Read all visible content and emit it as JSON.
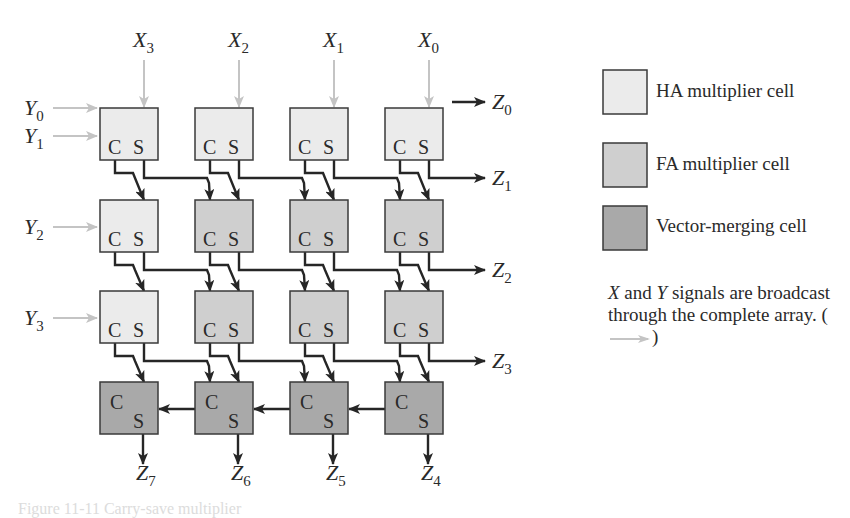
{
  "figure": {
    "colors": {
      "ha_fill": "#ebebeb",
      "fa_fill": "#cfcfcf",
      "vm_fill": "#a9a9a9",
      "border": "#3a3a3a",
      "wire": "#262626",
      "broadcast_arrow": "#c4c4c4",
      "text": "#2a2a2a"
    },
    "x_inputs": [
      "X3",
      "X2",
      "X1",
      "X0"
    ],
    "y_inputs": [
      {
        "name": "Y0",
        "row": 0,
        "offset": -12
      },
      {
        "name": "Y1",
        "row": 0,
        "offset": 16
      },
      {
        "name": "Y2",
        "row": 1,
        "offset": 0
      },
      {
        "name": "Y3",
        "row": 2,
        "offset": 0
      }
    ],
    "outputs_right": [
      {
        "name": "Z0",
        "row": -1
      },
      {
        "name": "Z1",
        "row": 0
      },
      {
        "name": "Z2",
        "row": 1
      },
      {
        "name": "Z3",
        "row": 2
      }
    ],
    "outputs_bottom": [
      "Z7",
      "Z6",
      "Z5",
      "Z4"
    ],
    "grid": {
      "rows": [
        [
          "HA",
          "HA",
          "HA",
          "HA"
        ],
        [
          "HA",
          "FA",
          "FA",
          "FA"
        ],
        [
          "HA",
          "FA",
          "FA",
          "FA"
        ],
        [
          "VM",
          "VM",
          "VM",
          "VM"
        ]
      ],
      "cell_labels": {
        "carry": "C",
        "sum": "S"
      }
    }
  },
  "legend": {
    "items": [
      {
        "type": "HA",
        "label": "HA multiplier cell"
      },
      {
        "type": "FA",
        "label": "FA multiplier cell"
      },
      {
        "type": "VM",
        "label": "Vector-merging cell"
      }
    ]
  },
  "note": {
    "x": "X",
    "and": " and ",
    "y": "Y",
    "rest": " signals are broadcast through the complete array. (",
    "close": ")"
  },
  "caption": "Figure 11-11 Carry-save multiplier"
}
